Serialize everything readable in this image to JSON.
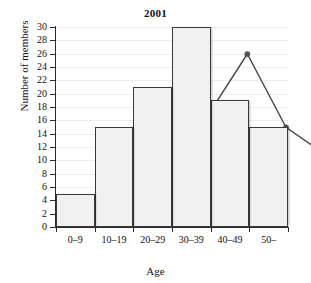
{
  "chart_data": {
    "type": "bar",
    "title": "2001",
    "xlabel": "Age",
    "ylabel": "Number of members",
    "categories": [
      "0–9",
      "10–19",
      "20–29",
      "30–39",
      "40–49",
      "50–"
    ],
    "values": [
      5,
      15,
      21,
      30,
      19,
      15
    ],
    "series": [
      {
        "name": "Number of members",
        "type": "bar",
        "values": [
          5,
          15,
          21,
          30,
          19,
          15
        ]
      },
      {
        "name": "Frequency polygon",
        "type": "line",
        "values": [
          5,
          15,
          21,
          30,
          19,
          15
        ]
      }
    ],
    "ylim": [
      0,
      30
    ],
    "ytick_step": 2,
    "ytick_labels": [
      "0",
      "2",
      "4",
      "6",
      "8",
      "10",
      "12",
      "14",
      "16",
      "18",
      "20",
      "22",
      "24",
      "26",
      "28",
      "30"
    ],
    "grid": true,
    "legend": "none",
    "colors": {
      "bar_fill": "#f1f1f1",
      "bar_stroke": "#3a3a3a",
      "line": "#4a4a4a",
      "marker": "#545454",
      "gridline": "#ececec",
      "axis": "#2b2b2b",
      "text": "#111111",
      "background": "#ffffff"
    }
  }
}
